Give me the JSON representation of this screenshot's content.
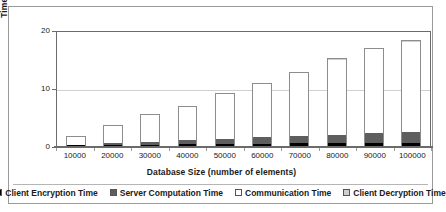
{
  "chart_data": {
    "type": "bar",
    "subtype": "stacked",
    "title": "",
    "xlabel": "Database Size (number of elements)",
    "ylabel": "Time (minutes)",
    "categories": [
      "10000",
      "20000",
      "30000",
      "40000",
      "50000",
      "60000",
      "70000",
      "80000",
      "90000",
      "100000"
    ],
    "ytick_labels": [
      "0",
      "10",
      "20"
    ],
    "ytick_values": [
      0,
      10,
      20
    ],
    "ylim": [
      0,
      20
    ],
    "grid": true,
    "grid_axis": "y",
    "legend_position": "bottom",
    "series": [
      {
        "name": "Client Encryption Time",
        "color": "#000000",
        "values": [
          0.15,
          0.2,
          0.25,
          0.3,
          0.35,
          0.4,
          0.45,
          0.5,
          0.55,
          0.6
        ]
      },
      {
        "name": "Server Computation Time",
        "color": "#5e5e5e",
        "values": [
          0.1,
          0.35,
          0.55,
          0.75,
          0.95,
          1.15,
          1.35,
          1.5,
          1.7,
          1.9
        ]
      },
      {
        "name": "Communication Time",
        "color": "#ffffff",
        "values": [
          1.6,
          3.2,
          4.85,
          6.0,
          7.95,
          9.5,
          11.15,
          13.25,
          14.8,
          15.85
        ]
      },
      {
        "name": "Client Decryption Time",
        "color": "#cfcfcf",
        "values": [
          0.05,
          0.05,
          0.05,
          0.05,
          0.05,
          0.05,
          0.05,
          0.05,
          0.05,
          0.05
        ]
      }
    ],
    "totals": [
      1.9,
      3.8,
      5.7,
      7.1,
      9.3,
      11.1,
      13.0,
      15.3,
      17.1,
      18.4
    ]
  },
  "legend": {
    "items": [
      {
        "label": "Client Encryption Time",
        "color": "#000000"
      },
      {
        "label": "Server Computation Time",
        "color": "#5e5e5e"
      },
      {
        "label": "Communication Time",
        "color": "#ffffff"
      },
      {
        "label": "Client Decryption Time",
        "color": "#cfcfcf"
      }
    ]
  }
}
